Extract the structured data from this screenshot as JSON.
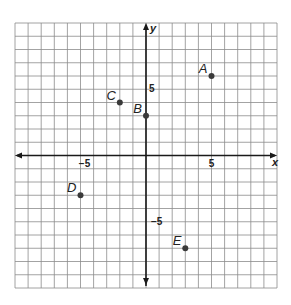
{
  "chart_data": {
    "type": "scatter",
    "title": "",
    "xlabel": "x",
    "ylabel": "y",
    "xlim": [
      -10,
      10
    ],
    "ylim": [
      -10,
      10
    ],
    "grid": true,
    "grid_step": 1,
    "x_tick_labels": [
      {
        "value": -5,
        "label": "−5"
      },
      {
        "value": 5,
        "label": "5"
      }
    ],
    "y_tick_labels": [
      {
        "value": 5,
        "label": "5"
      },
      {
        "value": -5,
        "label": "−5"
      }
    ],
    "points": [
      {
        "label": "A",
        "x": 5,
        "y": 6
      },
      {
        "label": "B",
        "x": 0,
        "y": 3
      },
      {
        "label": "C",
        "x": -2,
        "y": 4
      },
      {
        "label": "D",
        "x": -5,
        "y": -3
      },
      {
        "label": "E",
        "x": 3,
        "y": -7
      }
    ],
    "legend": null
  },
  "colors": {
    "grid": "#8c8c8c",
    "axis": "#1a1a1a",
    "point": "#3a3a3a",
    "text": "#222222"
  }
}
